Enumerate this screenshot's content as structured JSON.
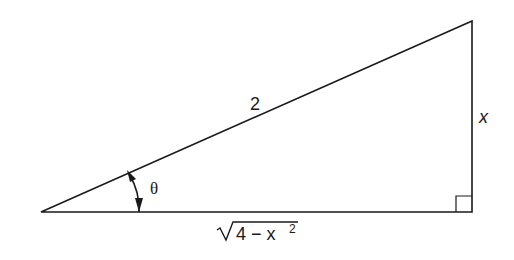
{
  "diagram": {
    "type": "right-triangle",
    "vertices": {
      "left": [
        41,
        212
      ],
      "top_right": [
        472,
        21
      ],
      "bottom_right": [
        472,
        212
      ]
    },
    "labels": {
      "hypotenuse": "2",
      "opposite": "x",
      "angle": "θ",
      "adjacent_radicand": "4 − x",
      "adjacent_exponent": "2"
    },
    "right_angle_marker": true,
    "stroke_color": "#1a1a1a"
  }
}
